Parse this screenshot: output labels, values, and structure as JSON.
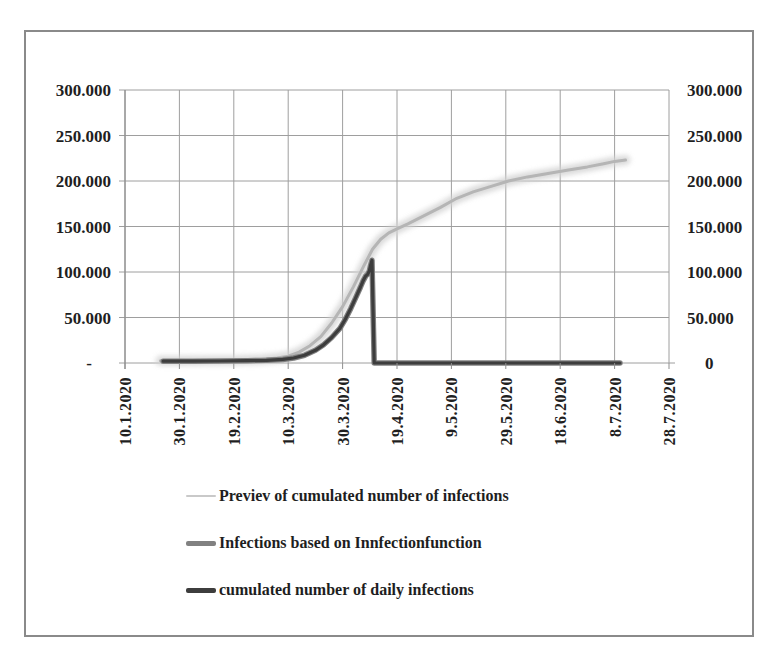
{
  "frame": {
    "border_color": "#8a8a8a",
    "background": "#ffffff"
  },
  "chart_data": {
    "type": "line",
    "title": "",
    "grid": true,
    "legend_position": "bottom-left",
    "colors": {
      "grid": "#9e9e9e",
      "axis": "#8f8f8f",
      "text": "#1f1f1f"
    },
    "x_axis": {
      "tick_labels": [
        "10.1.2020",
        "30.1.2020",
        "19.2.2020",
        "10.3.2020",
        "30.3.2020",
        "19.4.2020",
        "9.5.2020",
        "29.5.2020",
        "18.6.2020",
        "8.7.2020",
        "28.7.2020"
      ],
      "tick_days": [
        0,
        20,
        40,
        60,
        80,
        100,
        120,
        140,
        160,
        180,
        200
      ],
      "range_days": [
        0,
        200
      ]
    },
    "y_axis": {
      "tick_values": [
        300000,
        250000,
        200000,
        150000,
        100000,
        50000,
        0
      ],
      "left_tick_labels": [
        "300.000",
        "250.000",
        "200.000",
        "150.000",
        "100.000",
        "50.000",
        "-"
      ],
      "right_tick_labels": [
        "300.000",
        "250.000",
        "200.000",
        "150.000",
        "100.000",
        "50.000",
        "0"
      ],
      "ylim": [
        0,
        300000
      ]
    },
    "series": [
      {
        "id": "series-preview",
        "name": "Previev of cumulated number of infections",
        "color": "#c9c9c9",
        "style": "fuzzy",
        "width": 3,
        "points": [
          [
            13,
            2500
          ],
          [
            22,
            2500
          ],
          [
            32,
            2700
          ],
          [
            42,
            3000
          ],
          [
            50,
            4000
          ],
          [
            56,
            5500
          ],
          [
            60,
            7500
          ],
          [
            64,
            12000
          ],
          [
            68,
            19000
          ],
          [
            72,
            29000
          ],
          [
            76,
            44000
          ],
          [
            80,
            62000
          ],
          [
            84,
            84000
          ],
          [
            88,
            108000
          ],
          [
            91,
            125000
          ],
          [
            94,
            136000
          ],
          [
            97,
            143000
          ],
          [
            100,
            147500
          ],
          [
            104,
            153000
          ],
          [
            110,
            162000
          ],
          [
            116,
            171000
          ],
          [
            122,
            181000
          ],
          [
            128,
            188000
          ],
          [
            134,
            193500
          ],
          [
            141,
            200000
          ],
          [
            148,
            204500
          ],
          [
            155,
            208000
          ],
          [
            163,
            212000
          ],
          [
            170,
            215500
          ],
          [
            176,
            219000
          ],
          [
            180,
            221500
          ],
          [
            184,
            223000
          ]
        ]
      },
      {
        "id": "series-infectionfunction",
        "name": "Infections based on Innfectionfunction",
        "color": "#818181",
        "style": "solid",
        "width": 5.5,
        "points": [
          [
            14,
            2000
          ],
          [
            25,
            2000
          ],
          [
            35,
            2200
          ],
          [
            45,
            2500
          ],
          [
            52,
            3000
          ],
          [
            58,
            4000
          ],
          [
            62,
            5500
          ],
          [
            66,
            8500
          ],
          [
            70,
            14000
          ],
          [
            73,
            20000
          ],
          [
            76,
            28000
          ],
          [
            79,
            38000
          ],
          [
            81,
            48000
          ],
          [
            83,
            60000
          ],
          [
            85,
            73000
          ],
          [
            86.5,
            83000
          ],
          [
            87.5,
            90000
          ],
          [
            88.5,
            95500
          ],
          [
            89.2,
            97500
          ],
          [
            89.8,
            101000
          ],
          [
            90.2,
            106000
          ],
          [
            90.8,
            113000
          ],
          [
            91.6,
            0
          ],
          [
            95,
            0
          ],
          [
            105,
            0
          ],
          [
            120,
            0
          ],
          [
            135,
            0
          ],
          [
            150,
            0
          ],
          [
            165,
            0
          ],
          [
            175,
            0
          ],
          [
            182,
            0
          ]
        ]
      },
      {
        "id": "series-daily-cumulated",
        "name": "cumulated number of daily infections",
        "color": "#3d3d3d",
        "style": "solid",
        "width": 3.2,
        "points": [
          [
            14,
            2000
          ],
          [
            25,
            2000
          ],
          [
            35,
            2200
          ],
          [
            45,
            2500
          ],
          [
            52,
            3000
          ],
          [
            58,
            4000
          ],
          [
            62,
            5500
          ],
          [
            66,
            8500
          ],
          [
            70,
            14000
          ],
          [
            73,
            20000
          ],
          [
            76,
            28000
          ],
          [
            79,
            38000
          ],
          [
            81,
            48000
          ],
          [
            83,
            60000
          ],
          [
            85,
            73000
          ],
          [
            86.5,
            83000
          ],
          [
            87.5,
            90000
          ],
          [
            88.5,
            95500
          ],
          [
            89.2,
            97500
          ],
          [
            89.8,
            101000
          ],
          [
            90.2,
            106000
          ],
          [
            90.8,
            113000
          ],
          [
            91.6,
            0
          ],
          [
            95,
            0
          ],
          [
            105,
            0
          ],
          [
            120,
            0
          ],
          [
            135,
            0
          ],
          [
            150,
            0
          ],
          [
            165,
            0
          ],
          [
            175,
            0
          ],
          [
            182,
            0
          ]
        ]
      }
    ]
  }
}
